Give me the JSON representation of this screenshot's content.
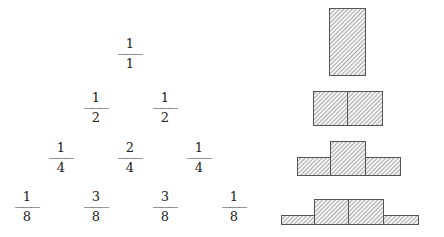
{
  "fraction_bar_glyph": "———",
  "rows": [
    {
      "fractions": [
        {
          "num": "1",
          "den": "1",
          "x": 130
        }
      ],
      "y": 37
    },
    {
      "fractions": [
        {
          "num": "1",
          "den": "2",
          "x": 96
        },
        {
          "num": "1",
          "den": "2",
          "x": 165
        }
      ],
      "y": 91
    },
    {
      "fractions": [
        {
          "num": "1",
          "den": "4",
          "x": 61
        },
        {
          "num": "2",
          "den": "4",
          "x": 130
        },
        {
          "num": "1",
          "den": "4",
          "x": 199
        }
      ],
      "y": 141
    },
    {
      "fractions": [
        {
          "num": "1",
          "den": "8",
          "x": 27
        },
        {
          "num": "3",
          "den": "8",
          "x": 96
        },
        {
          "num": "3",
          "den": "8",
          "x": 165
        },
        {
          "num": "1",
          "den": "8",
          "x": 234
        }
      ],
      "y": 190
    }
  ],
  "histograms": [
    {
      "label": "n=0",
      "bars": [
        {
          "x": 329,
          "w": 36,
          "y": 8,
          "h": 67
        }
      ]
    },
    {
      "label": "n=1",
      "bars": [
        {
          "x": 313,
          "w": 34,
          "y": 91,
          "h": 34
        },
        {
          "x": 347,
          "w": 35,
          "y": 91,
          "h": 34
        }
      ]
    },
    {
      "label": "n=2",
      "bars": [
        {
          "x": 297,
          "w": 33,
          "y": 157,
          "h": 18
        },
        {
          "x": 330,
          "w": 35,
          "y": 141,
          "h": 34
        },
        {
          "x": 365,
          "w": 35,
          "y": 157,
          "h": 18
        }
      ]
    },
    {
      "label": "n=3",
      "bars": [
        {
          "x": 281,
          "w": 33,
          "y": 215,
          "h": 9
        },
        {
          "x": 314,
          "w": 34,
          "y": 199,
          "h": 25
        },
        {
          "x": 348,
          "w": 35,
          "y": 199,
          "h": 25
        },
        {
          "x": 383,
          "w": 35,
          "y": 215,
          "h": 9
        }
      ]
    }
  ],
  "colors": {
    "stroke": "#555555",
    "hatch": "#8a8a8a",
    "fill": "#f4f4f4",
    "text": "#222222"
  }
}
